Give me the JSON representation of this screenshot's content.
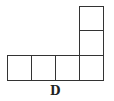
{
  "figure": {
    "label": "D",
    "cells": [
      {
        "col": 0,
        "row": 2
      },
      {
        "col": 1,
        "row": 2
      },
      {
        "col": 2,
        "row": 2
      },
      {
        "col": 3,
        "row": 2
      },
      {
        "col": 3,
        "row": 1
      },
      {
        "col": 3,
        "row": 0
      }
    ],
    "line_color": "#333333"
  }
}
